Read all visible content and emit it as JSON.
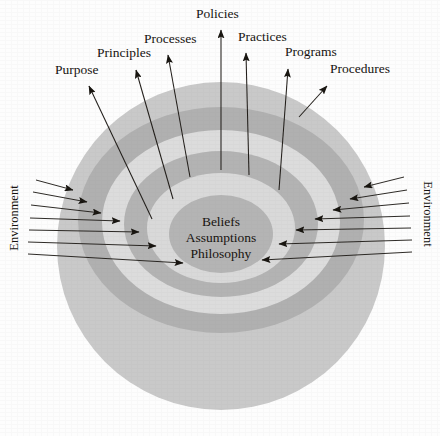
{
  "diagram": {
    "type": "concentric-onion",
    "background_color": "#fdfdfd",
    "ink_color": "#1a1713"
  },
  "core": {
    "lines": [
      "Beliefs",
      "Assumptions",
      "Philosophy"
    ]
  },
  "environment": {
    "left_label": "Environment",
    "right_label": "Environment",
    "left_arrow_count": 7,
    "right_arrow_count": 7
  },
  "callouts": [
    {
      "label": "Purpose",
      "x": 55,
      "y": 74,
      "anchor": "start"
    },
    {
      "label": "Principles",
      "x": 97,
      "y": 57,
      "anchor": "start"
    },
    {
      "label": "Processes",
      "x": 144,
      "y": 43,
      "anchor": "start"
    },
    {
      "label": "Policies",
      "x": 196,
      "y": 18,
      "anchor": "start"
    },
    {
      "label": "Practices",
      "x": 238,
      "y": 41,
      "anchor": "start"
    },
    {
      "label": "Programs",
      "x": 285,
      "y": 56,
      "anchor": "start"
    },
    {
      "label": "Procedures",
      "x": 330,
      "y": 73,
      "anchor": "start"
    }
  ],
  "rings": [
    {
      "name": "environment-field",
      "color": "#c9c9c9"
    },
    {
      "name": "ring-outer-dark",
      "color": "#b0b0b0"
    },
    {
      "name": "ring-light-1",
      "color": "#dcdcdc"
    },
    {
      "name": "ring-mid-dark",
      "color": "#b3b3b3"
    },
    {
      "name": "ring-light-2",
      "color": "#d9d9d9"
    },
    {
      "name": "core-disc",
      "color": "#b4b4b4"
    }
  ]
}
